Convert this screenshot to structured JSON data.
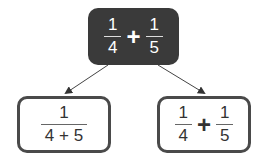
{
  "top_node": {
    "term1": {
      "numerator": "1",
      "denominator": "4"
    },
    "operator": "+",
    "term2": {
      "numerator": "1",
      "denominator": "5"
    }
  },
  "left_node": {
    "numerator": "1",
    "denominator": "4 + 5"
  },
  "right_node": {
    "term1": {
      "numerator": "1",
      "denominator": "4"
    },
    "operator": "+",
    "term2": {
      "numerator": "1",
      "denominator": "5"
    }
  },
  "colors": {
    "top_fill": "#3a3a3a",
    "border": "#4a4a4a",
    "arrow": "#444444"
  }
}
